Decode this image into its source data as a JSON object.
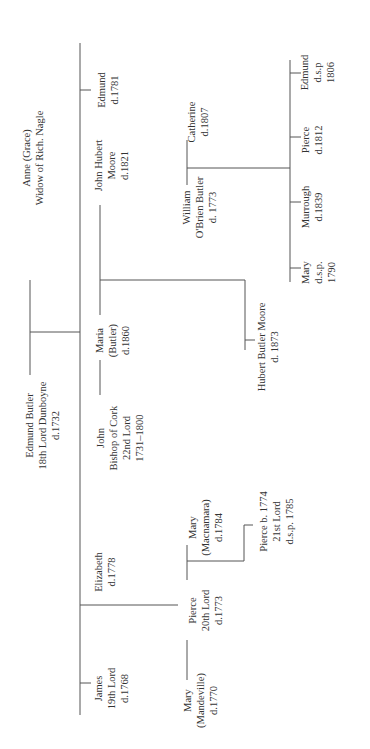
{
  "diagram": {
    "type": "family-tree",
    "orientation": "rotated-90-ccw",
    "line_color": "#555555",
    "text_color": "#333333"
  },
  "people": [
    {
      "id": "anne",
      "lines": [
        "Anne (Grace)",
        "Widow of Rich. Nagle"
      ],
      "cx": 33,
      "cy": 158
    },
    {
      "id": "edmund-butler",
      "lines": [
        "Edmund Butler",
        "18th Lord Dunboyne",
        "d.1732"
      ],
      "cx": 42,
      "cy": 425
    },
    {
      "id": "edmund-1781",
      "lines": [
        "Edmund",
        "d.1781"
      ],
      "cx": 108,
      "cy": 90
    },
    {
      "id": "john-hubert-moore",
      "lines": [
        "John Hubert",
        "Moore",
        "d.1821"
      ],
      "cx": 112,
      "cy": 165
    },
    {
      "id": "maria-butler",
      "lines": [
        "Maria",
        "(Butler)",
        "d.1860"
      ],
      "cx": 112,
      "cy": 340
    },
    {
      "id": "john-bishop",
      "lines": [
        "John",
        "Bishop of Cork",
        "22nd Lord",
        "1731–1800"
      ],
      "cx": 120,
      "cy": 438
    },
    {
      "id": "elizabeth",
      "lines": [
        "Elizabeth",
        "d.1778"
      ],
      "cx": 105,
      "cy": 572
    },
    {
      "id": "james",
      "lines": [
        "James",
        "19th Lord",
        "d.1768"
      ],
      "cx": 112,
      "cy": 688
    },
    {
      "id": "catherine",
      "lines": [
        "Catherine",
        "d.1807"
      ],
      "cx": 198,
      "cy": 122
    },
    {
      "id": "william-obrien",
      "lines": [
        "William",
        "O'Brien Butler",
        "d. 1773"
      ],
      "cx": 200,
      "cy": 207
    },
    {
      "id": "edmund-dsp",
      "lines": [
        "Edmund",
        "d.s.p",
        "1806"
      ],
      "cx": 318,
      "cy": 72
    },
    {
      "id": "pierce-1812",
      "lines": [
        "Pierce",
        "d.1812"
      ],
      "cx": 312,
      "cy": 140
    },
    {
      "id": "murrough",
      "lines": [
        "Murrough",
        "d.1839"
      ],
      "cx": 312,
      "cy": 207
    },
    {
      "id": "mary-dsp",
      "lines": [
        "Mary",
        "d.s.p.",
        "1790"
      ],
      "cx": 318,
      "cy": 272
    },
    {
      "id": "hubert-butler-moore",
      "lines": [
        "Hubert Butler Moore",
        "d. 1873"
      ],
      "cx": 268,
      "cy": 347
    },
    {
      "id": "mary-macnamara",
      "lines": [
        "Mary",
        "(Macnamara)",
        "d.1784"
      ],
      "cx": 205,
      "cy": 527
    },
    {
      "id": "pierce-20th",
      "lines": [
        "Pierce",
        "20th Lord",
        "d.1773"
      ],
      "cx": 206,
      "cy": 610
    },
    {
      "id": "mary-mandeville",
      "lines": [
        "Mary",
        "(Mandeville)",
        "d.1770"
      ],
      "cx": 200,
      "cy": 700
    },
    {
      "id": "pierce-21st",
      "lines": [
        "Pierce b. 1774",
        "21st Lord",
        "d.s.p. 1785"
      ],
      "cx": 276,
      "cy": 521
    }
  ],
  "lines": [
    {
      "name": "main-sibling-line",
      "x1": 80,
      "y1": 43,
      "x2": 80,
      "y2": 715
    },
    {
      "name": "parents-marriage-line",
      "x1": 30,
      "y1": 280,
      "x2": 30,
      "y2": 375
    },
    {
      "name": "parents-descent-line",
      "x1": 30,
      "y1": 332,
      "x2": 80,
      "y2": 332
    },
    {
      "name": "tick-edmund-1781",
      "x1": 80,
      "y1": 90,
      "x2": 91,
      "y2": 90
    },
    {
      "name": "tick-james",
      "x1": 80,
      "y1": 683,
      "x2": 91,
      "y2": 683
    },
    {
      "name": "elizabeth-descent-line",
      "x1": 80,
      "y1": 605,
      "x2": 178,
      "y2": 605
    },
    {
      "name": "maria-jh-marriage-line",
      "x1": 100,
      "y1": 205,
      "x2": 100,
      "y2": 315
    },
    {
      "name": "maria-jh-descent-line",
      "x1": 100,
      "y1": 280,
      "x2": 245,
      "y2": 280
    },
    {
      "name": "hubert-sibling-line",
      "x1": 245,
      "y1": 280,
      "x2": 245,
      "y2": 350
    },
    {
      "name": "tick-hubert",
      "x1": 245,
      "y1": 340,
      "x2": 255,
      "y2": 340
    },
    {
      "name": "john-maria-marriage-line",
      "x1": 100,
      "y1": 360,
      "x2": 100,
      "y2": 395
    },
    {
      "name": "william-catherine-marriage-line",
      "x1": 187,
      "y1": 140,
      "x2": 187,
      "y2": 185
    },
    {
      "name": "william-catherine-descent-line",
      "x1": 187,
      "y1": 168,
      "x2": 290,
      "y2": 168
    },
    {
      "name": "wc-children-sibling-line",
      "x1": 290,
      "y1": 60,
      "x2": 290,
      "y2": 282
    },
    {
      "name": "tick-edmund-dsp",
      "x1": 290,
      "y1": 73,
      "x2": 301,
      "y2": 73
    },
    {
      "name": "tick-pierce-1812",
      "x1": 290,
      "y1": 137,
      "x2": 301,
      "y2": 137
    },
    {
      "name": "tick-murrough",
      "x1": 290,
      "y1": 202,
      "x2": 301,
      "y2": 202
    },
    {
      "name": "tick-mary-dsp",
      "x1": 290,
      "y1": 268,
      "x2": 301,
      "y2": 268
    },
    {
      "name": "pierce-macnamara-marriage-line",
      "x1": 187,
      "y1": 545,
      "x2": 187,
      "y2": 580
    },
    {
      "name": "pierce-macnamara-descent-line",
      "x1": 187,
      "y1": 561,
      "x2": 244,
      "y2": 561
    },
    {
      "name": "pierce21-stem-line",
      "x1": 244,
      "y1": 525,
      "x2": 244,
      "y2": 561
    },
    {
      "name": "tick-pierce21",
      "x1": 244,
      "y1": 525,
      "x2": 253,
      "y2": 525
    },
    {
      "name": "pierce-mandeville-marriage-line",
      "x1": 187,
      "y1": 640,
      "x2": 187,
      "y2": 680
    }
  ]
}
